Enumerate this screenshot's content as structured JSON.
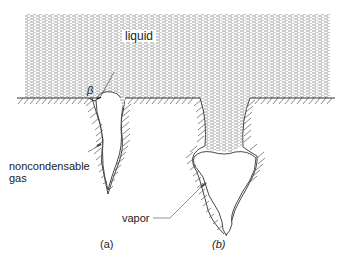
{
  "figure": {
    "labels": {
      "liquid": "liquid",
      "beta": "β",
      "gas_line1": "noncondensable",
      "gas_line2": "gas",
      "vapor": "vapor",
      "panel_a": "(a)",
      "panel_b": "(b)"
    },
    "colors": {
      "ink": "#333333",
      "liquid_hatch": "#9a9a9a",
      "background": "#ffffff"
    }
  }
}
